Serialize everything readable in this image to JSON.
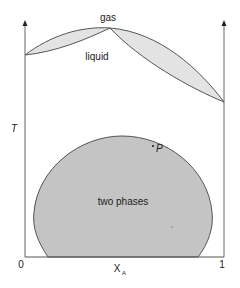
{
  "diagram": {
    "axes": {
      "y_label": "T",
      "x_label": "X",
      "x_label_subscript": "A",
      "x_tick_min": "0",
      "x_tick_max": "1"
    },
    "regions": {
      "gas": "gas",
      "liquid": "liquid",
      "two_phase": "two phases"
    },
    "point": {
      "label": "P"
    },
    "colors": {
      "line": "#555555",
      "lens_fill": "#e3e3e3",
      "dome_fill": "#c4c4c4",
      "axis": "#666666",
      "background": "#ffffff"
    }
  }
}
